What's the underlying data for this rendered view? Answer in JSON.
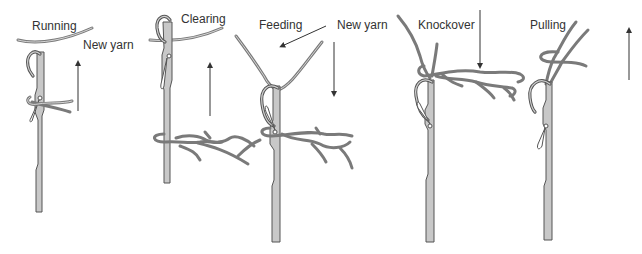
{
  "diagram": {
    "stages": [
      {
        "id": "running",
        "label": "Running",
        "direction": "up"
      },
      {
        "id": "clearing",
        "label": "Clearing",
        "direction": "up"
      },
      {
        "id": "feeding",
        "label": "Feeding",
        "direction": "down"
      },
      {
        "id": "knockover",
        "label": "Knockover",
        "direction": "down"
      },
      {
        "id": "pulling",
        "label": "Pulling",
        "direction": "up"
      }
    ],
    "annotations": {
      "new_yarn_1": "New yarn",
      "new_yarn_2": "New yarn"
    },
    "colors": {
      "needle_fill": "#c8c8c8",
      "outline": "#555555",
      "yarn": "#7a7a7a",
      "text": "#333333"
    }
  }
}
